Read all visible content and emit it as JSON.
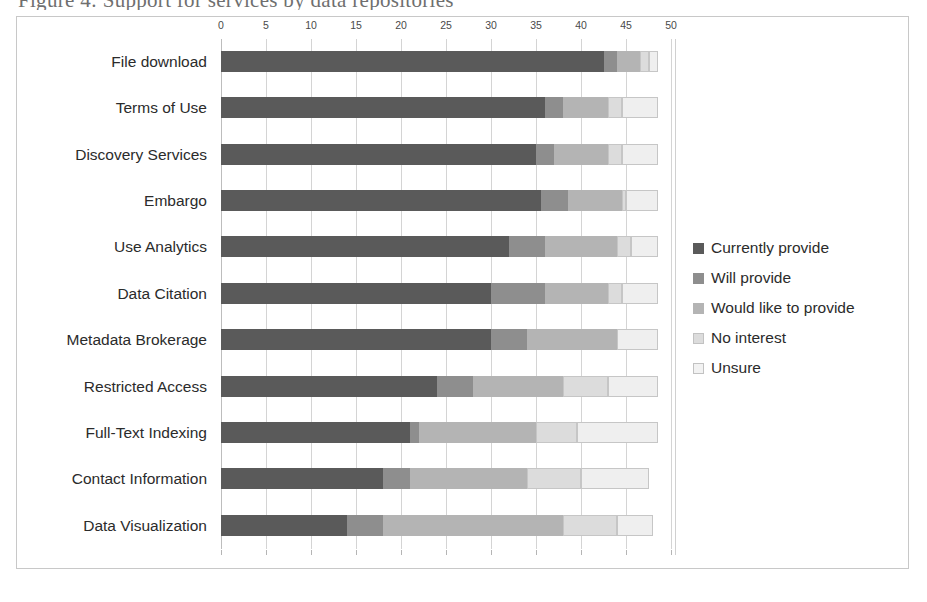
{
  "page": {
    "clipped_heading": "Figure 4: Support for services by data repositories"
  },
  "legend": {
    "position": "right",
    "items": [
      {
        "label": "Currently provide",
        "color": "#5a5a5a"
      },
      {
        "label": "Will provide",
        "color": "#8e8e8e"
      },
      {
        "label": "Would like to provide",
        "color": "#b4b4b4"
      },
      {
        "label": "No interest",
        "color": "#dcdcdc"
      },
      {
        "label": "Unsure",
        "color": "#efefef"
      }
    ]
  },
  "chart_data": {
    "type": "bar",
    "orientation": "horizontal",
    "stacked": true,
    "title": "",
    "subtitle": "",
    "xlabel": "",
    "ylabel": "",
    "xlim": [
      0,
      50
    ],
    "xticks": [
      0,
      5,
      10,
      15,
      20,
      25,
      30,
      35,
      40,
      45,
      50
    ],
    "xtick_labels": [
      "0",
      "5",
      "10",
      "15",
      "20",
      "25",
      "30",
      "35",
      "40",
      "45",
      "50"
    ],
    "grid": true,
    "legend_position": "right",
    "categories": [
      "File download",
      "Terms of Use",
      "Discovery Services",
      "Embargo",
      "Use Analytics",
      "Data Citation",
      "Metadata Brokerage",
      "Restricted Access",
      "Full-Text Indexing",
      "Contact Information",
      "Data Visualization"
    ],
    "series": [
      {
        "name": "Currently provide",
        "color": "#5a5a5a",
        "values": [
          42.5,
          36,
          35,
          35.5,
          32,
          30,
          30,
          24,
          21,
          18,
          14
        ]
      },
      {
        "name": "Will provide",
        "color": "#8e8e8e",
        "values": [
          1.5,
          2,
          2,
          3,
          4,
          6,
          4,
          4,
          1,
          3,
          4
        ]
      },
      {
        "name": "Would like to provide",
        "color": "#b4b4b4",
        "values": [
          2.5,
          5,
          6,
          6,
          8,
          7,
          10,
          10,
          13,
          13,
          20
        ]
      },
      {
        "name": "No interest",
        "color": "#dcdcdc",
        "values": [
          1,
          1.5,
          1.5,
          0.5,
          1.5,
          1.5,
          0,
          5,
          4.5,
          6,
          6
        ]
      },
      {
        "name": "Unsure",
        "color": "#efefef",
        "values": [
          1,
          4,
          4,
          3.5,
          3,
          4,
          4.5,
          5.5,
          9,
          7.5,
          4
        ]
      }
    ]
  }
}
